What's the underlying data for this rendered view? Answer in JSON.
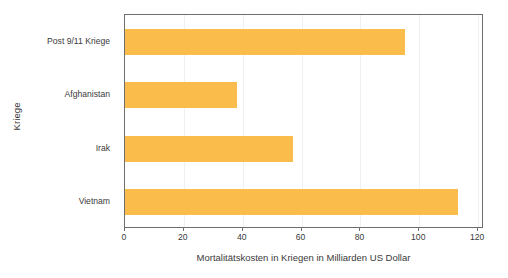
{
  "chart_data": {
    "type": "bar",
    "orientation": "horizontal",
    "title": "",
    "xlabel": "Mortalitätskosten in Kriegen in Milliarden US Dollar",
    "ylabel": "Kriege",
    "categories": [
      "Post 9/11 Kriege",
      "Afghanistan",
      "Irak",
      "Vietnam"
    ],
    "values": [
      95,
      38,
      57,
      113
    ],
    "xlim": [
      0,
      122
    ],
    "xticks": [
      0,
      20,
      40,
      60,
      80,
      100,
      120
    ],
    "xticklabels": [
      "0",
      "20",
      "40",
      "60",
      "80",
      "100",
      "120"
    ],
    "grid": true,
    "grid_axis": "x",
    "legend": null,
    "bar_color": "#fabd4c",
    "axis_color": "#6e6e6e",
    "grid_color": "#f0f0f0",
    "text_color": "#3a3a3a",
    "background": "#ffffff"
  }
}
